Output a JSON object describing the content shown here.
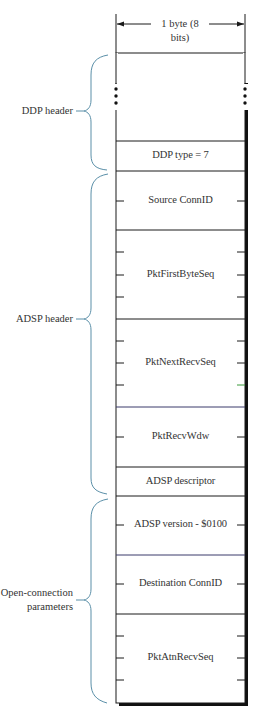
{
  "header": {
    "width_label": "1 byte (8 bits)"
  },
  "groups": [
    {
      "label": "DDP header",
      "lines": [
        "DDP header"
      ]
    },
    {
      "label": "ADSP header",
      "lines": [
        "ADSP header"
      ]
    },
    {
      "label": "Open-connection parameters",
      "lines": [
        "Open-connection",
        "parameters"
      ]
    }
  ],
  "fields": [
    {
      "label": "",
      "note": "earlier DDP header fields (elided)",
      "bytes": "..."
    },
    {
      "label": "DDP type = 7",
      "bytes": 1
    },
    {
      "label": "Source ConnID",
      "bytes": 2
    },
    {
      "label": "PktFirstByteSeq",
      "bytes": 4
    },
    {
      "label": "PktNextRecvSeq",
      "bytes": 4
    },
    {
      "label": "PktRecvWdw",
      "bytes": 2
    },
    {
      "label": "ADSP descriptor",
      "bytes": 1
    },
    {
      "label": "ADSP version - $0100",
      "bytes": 2
    },
    {
      "label": "Destination ConnID",
      "bytes": 2
    },
    {
      "label": "PktAtnRecvSeq",
      "bytes": 4
    }
  ],
  "colors": {
    "line": "#1a1a1a",
    "brace": "#5a8fa8",
    "text": "#333333"
  }
}
